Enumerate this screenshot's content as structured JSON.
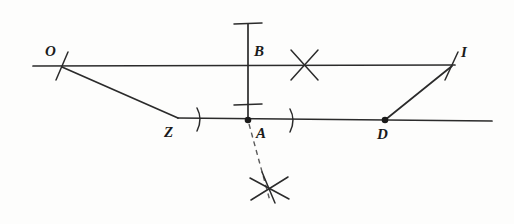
{
  "figure": {
    "type": "geometry-construction-diagram",
    "width": 514,
    "height": 224,
    "background_color": "#fdfdfc",
    "ink_color": "#2b2b2b"
  },
  "labels": {
    "o": "O",
    "b": "B",
    "i": "I",
    "z": "Z",
    "a": "A",
    "d": "D"
  },
  "points": [
    {
      "name": "O",
      "label": "O",
      "x": 62,
      "y": 66,
      "marker": "slash-tick",
      "label_x": 48,
      "label_y": 56
    },
    {
      "name": "B",
      "label": "B",
      "x": 248,
      "y": 65,
      "marker": "none",
      "label_x": 255,
      "label_y": 55
    },
    {
      "name": "I",
      "label": "I",
      "x": 452,
      "y": 65,
      "marker": "slash-tick",
      "label_x": 460,
      "label_y": 56
    },
    {
      "name": "Z",
      "label": "Z",
      "x": 178,
      "y": 118,
      "marker": "none",
      "label_x": 166,
      "label_y": 137
    },
    {
      "name": "A",
      "label": "A",
      "x": 248,
      "y": 120,
      "marker": "filled-dot",
      "label_x": 256,
      "label_y": 137
    },
    {
      "name": "D",
      "label": "D",
      "x": 385,
      "y": 120,
      "marker": "filled-dot",
      "label_x": 379,
      "label_y": 138
    }
  ],
  "lines": [
    {
      "name": "upper-horizontal-line",
      "x1": 33,
      "y1": 66,
      "x2": 455,
      "y2": 65,
      "style": "solid"
    },
    {
      "name": "lower-horizontal-line",
      "x1": 178,
      "y1": 118,
      "x2": 492,
      "y2": 121,
      "style": "solid"
    },
    {
      "name": "vertical-line-through-b-a",
      "x1": 248,
      "y1": 24,
      "x2": 248,
      "y2": 121,
      "style": "solid"
    },
    {
      "name": "segment-o-to-z",
      "x1": 62,
      "y1": 67,
      "x2": 178,
      "y2": 118,
      "style": "solid"
    },
    {
      "name": "segment-d-to-i",
      "x1": 385,
      "y1": 120,
      "x2": 452,
      "y2": 66,
      "style": "solid"
    },
    {
      "name": "dashed-perpendicular-below-a",
      "x1": 248,
      "y1": 124,
      "x2": 270,
      "y2": 200,
      "style": "dashed"
    }
  ],
  "marks": [
    {
      "name": "tick-top-of-vertical",
      "kind": "cross-tick",
      "x": 248,
      "y": 24
    },
    {
      "name": "tick-above-a",
      "kind": "cross-tick",
      "x": 248,
      "y": 105
    },
    {
      "name": "arc-intersection-upper",
      "kind": "x-cross",
      "x": 305,
      "y": 65
    },
    {
      "name": "arc-intersection-lower",
      "kind": "x-cross",
      "x": 270,
      "y": 190
    },
    {
      "name": "arc-mark-left-of-a",
      "kind": "arc-tick",
      "x": 200,
      "y": 119
    },
    {
      "name": "arc-mark-right-of-a",
      "kind": "arc-tick",
      "x": 293,
      "y": 120
    }
  ]
}
